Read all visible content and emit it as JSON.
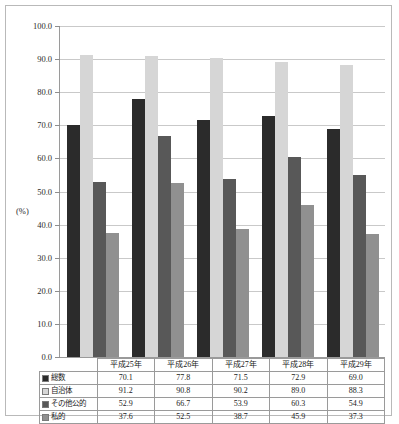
{
  "chart_data": {
    "type": "bar",
    "title": "",
    "xlabel": "",
    "ylabel": "(%)",
    "ylim": [
      0.0,
      100.0
    ],
    "ytick_step": 10.0,
    "ytick_labels": [
      "100.0",
      "90.0",
      "80.0",
      "70.0",
      "60.0",
      "50.0",
      "40.0",
      "30.0",
      "20.0",
      "10.0",
      "0.0"
    ],
    "grid": true,
    "legend_position": "table-below",
    "categories": [
      "平成25年",
      "平成26年",
      "平成27年",
      "平成28年",
      "平成29年"
    ],
    "series": [
      {
        "name": "総数",
        "color": "#2b2b2b",
        "values": [
          70.1,
          77.8,
          71.5,
          72.9,
          69.0
        ]
      },
      {
        "name": "自治体",
        "color": "#d6d6d6",
        "values": [
          91.2,
          90.8,
          90.2,
          89.0,
          88.3
        ]
      },
      {
        "name": "その他公的",
        "color": "#585858",
        "values": [
          52.9,
          66.7,
          53.9,
          60.3,
          54.9
        ]
      },
      {
        "name": "私的",
        "color": "#909090",
        "values": [
          37.6,
          52.5,
          38.7,
          45.9,
          37.3
        ]
      }
    ]
  },
  "axis": {
    "unit_label": "(%)"
  },
  "table": {
    "corner_label": "",
    "column_headers": [
      "平成25年",
      "平成26年",
      "平成27年",
      "平成28年",
      "平成29年"
    ],
    "rows": [
      {
        "label": "総数",
        "color": "#2b2b2b",
        "cells": [
          "70.1",
          "77.8",
          "71.5",
          "72.9",
          "69.0"
        ]
      },
      {
        "label": "自治体",
        "color": "#d6d6d6",
        "cells": [
          "91.2",
          "90.8",
          "90.2",
          "89.0",
          "88.3"
        ]
      },
      {
        "label": "その他公的",
        "color": "#585858",
        "cells": [
          "52.9",
          "66.7",
          "53.9",
          "60.3",
          "54.9"
        ]
      },
      {
        "label": "私的",
        "color": "#909090",
        "cells": [
          "37.6",
          "52.5",
          "38.7",
          "45.9",
          "37.3"
        ]
      }
    ]
  }
}
